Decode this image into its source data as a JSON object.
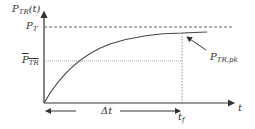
{
  "diagram": {
    "y_axis_label": {
      "main": "P",
      "sub": "TR",
      "suffix": "(t)"
    },
    "p_t_label": {
      "main": "P",
      "sub": "T"
    },
    "p_tr_avg_label": {
      "main": "P",
      "sub": "TR"
    },
    "p_tr_pk_label": {
      "main": "P",
      "sub": "TR,pk"
    },
    "x_axis_label": "t",
    "t_f_label": {
      "main": "t",
      "sub": "f"
    },
    "delta_t_label": "Δt"
  },
  "colors": {
    "axis": "#333333",
    "curve": "#444444",
    "dashed": "#555555",
    "dotted": "#888888",
    "text": "#333333"
  }
}
